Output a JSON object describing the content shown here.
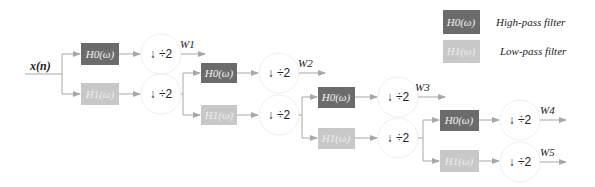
{
  "diagram": {
    "title": "",
    "input_label": "x(n)",
    "high_pass_label": "H0(ω)",
    "low_pass_label": "H1(ω)",
    "downsample_label": "↓ ÷2",
    "outputs": [
      "W1",
      "W2",
      "W3",
      "W4",
      "W5"
    ],
    "legend": {
      "high_pass": {
        "box": "H0(ω)",
        "text": "High-pass filter"
      },
      "low_pass": {
        "box": "H1(ω)",
        "text": "Low-pass filter"
      }
    },
    "colors": {
      "high_pass": "#6b6b6b",
      "low_pass": "#c8c8c8",
      "lines": "#a8a8a8",
      "circle": "#eeeeee"
    },
    "stages": [
      {
        "level": 1,
        "output": "W1"
      },
      {
        "level": 2,
        "output": "W2"
      },
      {
        "level": 3,
        "output": "W3"
      },
      {
        "level": 4,
        "outputs": [
          "W4",
          "W5"
        ]
      }
    ]
  }
}
